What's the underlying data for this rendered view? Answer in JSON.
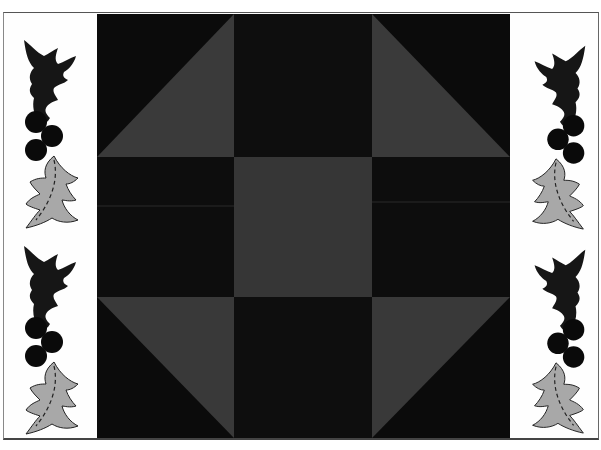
{
  "artwork": {
    "description": "Quilt block (Churn Dash / Monkey Wrench style) flanked by holly borders",
    "colors": {
      "background": "#fdfdfd",
      "quilt_dark": "#0b0b0b",
      "quilt_patch_dark": "#0e0e0e",
      "quilt_grey": "#3a3a3a",
      "holly_leaf_dark": "#161616",
      "holly_leaf_light": "#a8a8a8",
      "berry": "#0a0a0a"
    },
    "quilt_block": {
      "grid": "3x3",
      "center_patch": "grey square",
      "side_patches": "dark rectangles",
      "corner_patches": "half-square triangles grey/dark"
    },
    "borders": {
      "left": {
        "motifs": 2,
        "motif": "holly-sprig"
      },
      "right": {
        "motifs": 2,
        "motif": "holly-sprig-mirrored"
      }
    }
  }
}
